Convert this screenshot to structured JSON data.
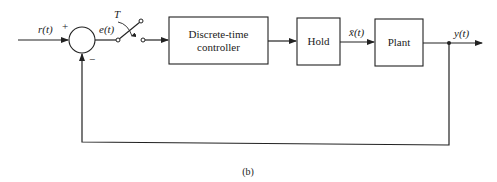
{
  "diagram": {
    "type": "sampled-data feedback control block diagram",
    "caption": "(b)",
    "signals": {
      "input": "r(t)",
      "error": "e(t)",
      "hold_output": "x̄(t)",
      "output": "y(t)"
    },
    "summing_junction": {
      "plus_sign": "+",
      "minus_sign": "−"
    },
    "sampler": {
      "label": "T"
    },
    "blocks": [
      {
        "id": "controller",
        "line1": "Discrete-time",
        "line2": "controller"
      },
      {
        "id": "hold",
        "line1": "Hold"
      },
      {
        "id": "plant",
        "line1": "Plant"
      }
    ],
    "feedback": "unity negative feedback from y(t) to summing junction"
  }
}
